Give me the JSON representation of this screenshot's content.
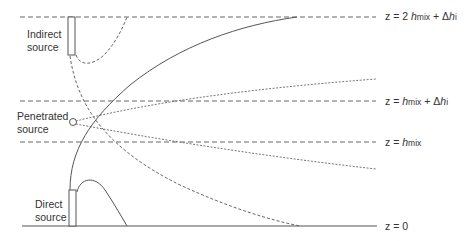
{
  "diagram": {
    "sources": {
      "indirect": {
        "line1": "Indirect",
        "line2": "source"
      },
      "penetrated": {
        "line1": "Penetrated",
        "line2": "source"
      },
      "direct": {
        "line1": "Direct",
        "line2": "source"
      }
    },
    "levels": {
      "top": {
        "prefix": "z = 2 ",
        "h": "h",
        "sub": "mix",
        "plus": " + Δ",
        "h2": "h",
        "sub2": "i"
      },
      "upper": {
        "prefix": "z = ",
        "h": "h",
        "sub": "mix",
        "plus": " + Δ",
        "h2": "h",
        "sub2": "i"
      },
      "mix": {
        "prefix": "z = ",
        "h": "h",
        "sub": "mix"
      },
      "ground": {
        "text": "z = 0"
      }
    },
    "colors": {
      "line": "#555555",
      "text": "#333333"
    }
  }
}
